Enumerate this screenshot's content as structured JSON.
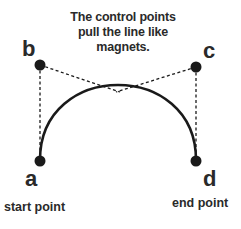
{
  "caption": "The control points pull the line like magnets.",
  "points": {
    "a": {
      "label": "a",
      "description": "start point"
    },
    "b": {
      "label": "b"
    },
    "c": {
      "label": "c"
    },
    "d": {
      "label": "d",
      "description": "end point"
    }
  },
  "colors": {
    "stroke": "#1a1a1a",
    "background": "#ffffff"
  }
}
